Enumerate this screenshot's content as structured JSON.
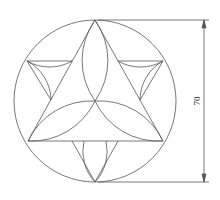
{
  "drawing": {
    "dimension_label": "70",
    "line_color": "#555555"
  }
}
